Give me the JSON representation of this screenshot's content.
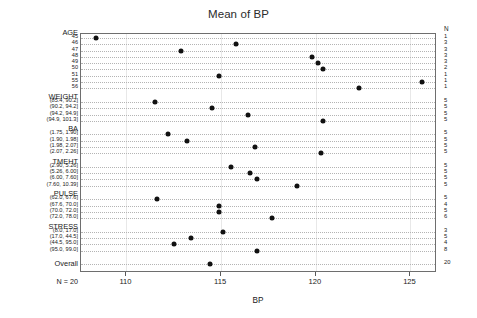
{
  "chart_data": {
    "type": "scatter",
    "title": "Mean of BP",
    "xlabel": "BP",
    "ylabel": "",
    "xlim": [
      107.6,
      126.4
    ],
    "xticks": [
      110,
      115,
      120,
      125
    ],
    "xtick_labels": [
      "110",
      "115",
      "120",
      "125"
    ],
    "grid": true,
    "legend": null,
    "n_column_header": "N",
    "n_total_note": "N = 20",
    "orientation": "horizontal",
    "groups": [
      {
        "name": "AGE",
        "levels": [
          {
            "label": "45",
            "value": 108.4,
            "n": "1"
          },
          {
            "label": "46",
            "value": 115.8,
            "n": "3"
          },
          {
            "label": "47",
            "value": 112.9,
            "n": "3"
          },
          {
            "label": "48",
            "value": 119.8,
            "n": "3"
          },
          {
            "label": "49",
            "value": 120.1,
            "n": "3"
          },
          {
            "label": "50",
            "value": 120.4,
            "n": "2"
          },
          {
            "label": "51",
            "value": 114.9,
            "n": "1"
          },
          {
            "label": "55",
            "value": 125.6,
            "n": "1"
          },
          {
            "label": "56",
            "value": 122.3,
            "n": "1"
          }
        ]
      },
      {
        "name": "WEIGHT",
        "levels": [
          {
            "label": "(85.4, 90.2]",
            "value": 111.5,
            "n": "5"
          },
          {
            "label": "(90.2, 94.2]",
            "value": 114.5,
            "n": "5"
          },
          {
            "label": "(94.2, 94.9]",
            "value": 116.4,
            "n": "5"
          },
          {
            "label": "(94.9, 101.3]",
            "value": 120.4,
            "n": "5"
          }
        ]
      },
      {
        "name": "BA",
        "levels": [
          {
            "label": "(1.75, 1.90]",
            "value": 112.2,
            "n": "5"
          },
          {
            "label": "(1.90, 1.98]",
            "value": 113.2,
            "n": "5"
          },
          {
            "label": "(1.98, 2.07]",
            "value": 116.8,
            "n": "5"
          },
          {
            "label": "(2.07, 2.26]",
            "value": 120.3,
            "n": "5"
          }
        ]
      },
      {
        "name": "TMEHT",
        "levels": [
          {
            "label": "(2.90, 5.26]",
            "value": 115.5,
            "n": "5"
          },
          {
            "label": "(5.26, 6.00]",
            "value": 116.5,
            "n": "5"
          },
          {
            "label": "(6.00, 7.60]",
            "value": 116.9,
            "n": "5"
          },
          {
            "label": "(7.60, 10.39]",
            "value": 119.0,
            "n": "5"
          }
        ]
      },
      {
        "name": "PULSE",
        "levels": [
          {
            "label": "(62.0, 67.6]",
            "value": 111.6,
            "n": "5"
          },
          {
            "label": "(67.6, 70.0]",
            "value": 114.9,
            "n": "4"
          },
          {
            "label": "(70.0, 72.0]",
            "value": 114.9,
            "n": "5"
          },
          {
            "label": "(72.0, 78.0]",
            "value": 117.7,
            "n": "6"
          }
        ]
      },
      {
        "name": "STRESS",
        "levels": [
          {
            "label": "(8.0, 17.0]",
            "value": 115.1,
            "n": "3"
          },
          {
            "label": "(17.0, 44.5]",
            "value": 113.4,
            "n": "5"
          },
          {
            "label": "(44.5, 95.0]",
            "value": 112.5,
            "n": "4"
          },
          {
            "label": "(95.0, 99.0]",
            "value": 116.9,
            "n": "8"
          }
        ]
      },
      {
        "name": "Overall",
        "levels": [
          {
            "label": "",
            "value": 114.4,
            "n": "20"
          }
        ]
      }
    ]
  }
}
